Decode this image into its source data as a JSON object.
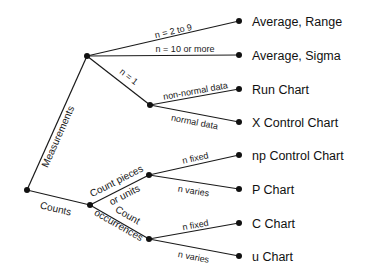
{
  "diagram": {
    "type": "decision-tree",
    "root": {
      "branches": [
        {
          "label": "Measurements",
          "branches": [
            {
              "label": "n = 2 to 9",
              "result": "Average, Range"
            },
            {
              "label": "n = 10 or more",
              "result": "Average, Sigma"
            },
            {
              "label": "n = 1",
              "branches": [
                {
                  "label": "non-normal data",
                  "result": "Run Chart"
                },
                {
                  "label": "normal data",
                  "result": "X Control Chart"
                }
              ]
            }
          ]
        },
        {
          "label": "Counts",
          "branches": [
            {
              "label": "Count pieces or units",
              "label_lines": [
                "Count pieces",
                "or units"
              ],
              "branches": [
                {
                  "label": "n fixed",
                  "result": "np Control Chart"
                },
                {
                  "label": "n varies",
                  "result": "P Chart"
                }
              ]
            },
            {
              "label": "Count occurrences",
              "label_lines": [
                "Count",
                "occurrences"
              ],
              "branches": [
                {
                  "label": "n fixed",
                  "result": "C Chart"
                },
                {
                  "label": "n varies",
                  "result": "u Chart"
                }
              ]
            }
          ]
        }
      ]
    },
    "labels": {
      "measurements": "Measurements",
      "counts": "Counts",
      "n_2_to_9": "n = 2 to 9",
      "n_10_or_more": "n = 10 or more",
      "n_1": "n = 1",
      "non_normal": "non-normal data",
      "normal": "normal data",
      "count_pieces_1": "Count pieces",
      "count_pieces_2": "or units",
      "count_occ_1": "Count",
      "count_occ_2": "occurrences",
      "pieces_fixed": "n fixed",
      "pieces_varies": "n varies",
      "occ_fixed": "n fixed",
      "occ_varies": "n varies"
    },
    "results": [
      "Average, Range",
      "Average, Sigma",
      "Run Chart",
      "X Control Chart",
      "np Control Chart",
      "P Chart",
      "C Chart",
      "u Chart"
    ],
    "colors": {
      "line": "#1a1a1a",
      "node": "#111111",
      "background": "#ffffff"
    }
  }
}
